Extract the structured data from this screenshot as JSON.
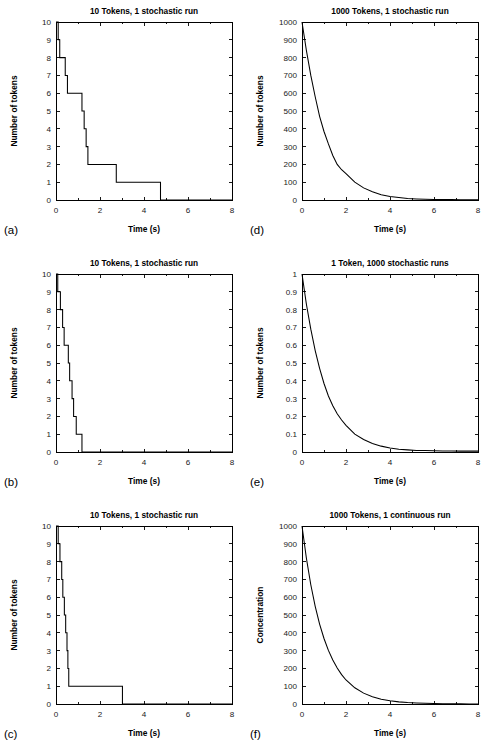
{
  "figure": {
    "background": "#ffffff",
    "line_color": "#000000",
    "panel_count": 6
  },
  "chart_data": [
    {
      "panel": "a",
      "panel_letter": "(a)",
      "type": "line",
      "style": "step",
      "title": "10 Tokens, 1 stochastic run",
      "xlabel": "Time (s)",
      "ylabel": "Number of tokens",
      "xlim": [
        0,
        8
      ],
      "ylim": [
        0,
        10
      ],
      "xticks": [
        0,
        2,
        4,
        6,
        8
      ],
      "xtick_labels": [
        "0",
        "2",
        "4",
        "6",
        "8"
      ],
      "xminor_count": 2,
      "yticks": [
        0,
        1,
        2,
        3,
        4,
        5,
        6,
        7,
        8,
        9,
        10
      ],
      "ytick_labels": [
        "0",
        "1",
        "2",
        "3",
        "4",
        "5",
        "6",
        "7",
        "8",
        "9",
        "10"
      ],
      "grid": false,
      "legend": null,
      "series": [
        {
          "name": "tokens remaining",
          "x": [
            0.0,
            0.1,
            0.1,
            0.17,
            0.17,
            0.42,
            0.42,
            0.52,
            0.52,
            0.62,
            0.62,
            1.18,
            1.18,
            1.28,
            1.28,
            1.37,
            1.37,
            1.45,
            1.45,
            2.74,
            2.74,
            4.75,
            4.75
          ],
          "y": [
            10,
            10,
            9,
            9,
            8,
            8,
            7,
            7,
            6,
            6,
            6,
            6,
            5,
            5,
            4,
            4,
            3,
            3,
            2,
            2,
            1,
            1,
            0
          ]
        }
      ]
    },
    {
      "panel": "b",
      "panel_letter": "(b)",
      "type": "line",
      "style": "step",
      "title": "10 Tokens, 1 stochastic run",
      "xlabel": "Time (s)",
      "ylabel": "Number of tokens",
      "xlim": [
        0,
        8
      ],
      "ylim": [
        0,
        10
      ],
      "xticks": [
        0,
        2,
        4,
        6,
        8
      ],
      "xtick_labels": [
        "0",
        "2",
        "4",
        "6",
        "8"
      ],
      "xminor_count": 2,
      "yticks": [
        0,
        1,
        2,
        3,
        4,
        5,
        6,
        7,
        8,
        9,
        10
      ],
      "ytick_labels": [
        "0",
        "1",
        "2",
        "3",
        "4",
        "5",
        "6",
        "7",
        "8",
        "9",
        "10"
      ],
      "grid": false,
      "legend": null,
      "series": [
        {
          "name": "tokens remaining",
          "x": [
            0.0,
            0.08,
            0.08,
            0.2,
            0.2,
            0.3,
            0.3,
            0.37,
            0.37,
            0.44,
            0.44,
            0.56,
            0.56,
            0.62,
            0.62,
            0.73,
            0.73,
            0.8,
            0.8,
            0.92,
            0.92,
            1.18,
            1.18
          ],
          "y": [
            10,
            10,
            9,
            9,
            8,
            8,
            7,
            7,
            6,
            6,
            6,
            6,
            5,
            5,
            4,
            4,
            3,
            3,
            2,
            2,
            1,
            1,
            0
          ]
        }
      ]
    },
    {
      "panel": "c",
      "panel_letter": "(c)",
      "type": "line",
      "style": "step",
      "title": "10 Tokens, 1 stochastic run",
      "xlabel": "Time (s)",
      "ylabel": "Number of tokens",
      "xlim": [
        0,
        8
      ],
      "ylim": [
        0,
        10
      ],
      "xticks": [
        0,
        2,
        4,
        6,
        8
      ],
      "xtick_labels": [
        "0",
        "2",
        "4",
        "6",
        "8"
      ],
      "xminor_count": 2,
      "yticks": [
        0,
        1,
        2,
        3,
        4,
        5,
        6,
        7,
        8,
        9,
        10
      ],
      "ytick_labels": [
        "0",
        "1",
        "2",
        "3",
        "4",
        "5",
        "6",
        "7",
        "8",
        "9",
        "10"
      ],
      "grid": false,
      "legend": null,
      "series": [
        {
          "name": "tokens remaining",
          "x": [
            0.0,
            0.1,
            0.1,
            0.18,
            0.18,
            0.26,
            0.26,
            0.31,
            0.31,
            0.38,
            0.38,
            0.44,
            0.44,
            0.5,
            0.5,
            0.54,
            0.54,
            0.58,
            0.58,
            0.95,
            0.95,
            3.02,
            3.02
          ],
          "y": [
            10,
            10,
            9,
            9,
            8,
            8,
            7,
            7,
            6,
            6,
            5,
            5,
            4,
            4,
            3,
            3,
            2,
            2,
            1,
            1,
            1,
            1,
            0
          ]
        }
      ]
    },
    {
      "panel": "d",
      "panel_letter": "(d)",
      "type": "line",
      "style": "smooth",
      "title": "1000 Tokens, 1 stochastic run",
      "xlabel": "Time (s)",
      "ylabel": "Number of tokens",
      "xlim": [
        0,
        8
      ],
      "ylim": [
        0,
        1000
      ],
      "xticks": [
        0,
        2,
        4,
        6,
        8
      ],
      "xtick_labels": [
        "0",
        "2",
        "4",
        "6",
        "8"
      ],
      "xminor_count": 2,
      "yticks": [
        0,
        100,
        200,
        300,
        400,
        500,
        600,
        700,
        800,
        900,
        1000
      ],
      "ytick_labels": [
        "0",
        "100",
        "200",
        "300",
        "400",
        "500",
        "600",
        "700",
        "800",
        "900",
        "1000"
      ],
      "grid": false,
      "legend": null,
      "decay_constant": 1.0,
      "initial_value": 1000,
      "series": [
        {
          "name": "tokens remaining",
          "x": [
            0.0,
            0.2,
            0.4,
            0.6,
            0.8,
            1.0,
            1.2,
            1.4,
            1.6,
            1.8,
            2.0,
            2.4,
            2.8,
            3.2,
            3.6,
            4.0,
            4.4,
            4.8,
            5.2,
            5.6,
            6.0,
            6.4,
            6.8,
            7.2,
            7.6,
            8.0
          ],
          "y": [
            1000,
            840,
            700,
            580,
            470,
            385,
            315,
            250,
            200,
            170,
            148,
            100,
            68,
            46,
            30,
            20,
            14,
            9,
            6,
            4,
            3,
            2,
            2,
            1,
            1,
            1
          ]
        }
      ]
    },
    {
      "panel": "e",
      "panel_letter": "(e)",
      "type": "line",
      "style": "smooth",
      "title": "1 Token, 1000 stochastic runs",
      "xlabel": "Time (s)",
      "ylabel": "Number of tokens",
      "xlim": [
        0,
        8
      ],
      "ylim": [
        0,
        1
      ],
      "xticks": [
        0,
        2,
        4,
        6,
        8
      ],
      "xtick_labels": [
        "0",
        "2",
        "4",
        "6",
        "8"
      ],
      "xminor_count": 2,
      "yticks": [
        0,
        0.1,
        0.2,
        0.3,
        0.4,
        0.5,
        0.6,
        0.7,
        0.8,
        0.9,
        1
      ],
      "ytick_labels": [
        "0",
        "0.1",
        "0.2",
        "0.3",
        "0.4",
        "0.5",
        "0.6",
        "0.7",
        "0.8",
        "0.9",
        "1"
      ],
      "grid": false,
      "legend": null,
      "decay_constant": 1.0,
      "initial_value": 1,
      "series": [
        {
          "name": "mean tokens remaining",
          "x": [
            0.0,
            0.2,
            0.4,
            0.6,
            0.8,
            1.0,
            1.2,
            1.4,
            1.6,
            1.8,
            2.0,
            2.4,
            2.8,
            3.2,
            3.6,
            4.0,
            4.4,
            4.8,
            5.2,
            5.6,
            6.0,
            6.4,
            6.8,
            7.2,
            7.6,
            8.0
          ],
          "y": [
            1.0,
            0.83,
            0.69,
            0.57,
            0.47,
            0.385,
            0.315,
            0.26,
            0.215,
            0.18,
            0.15,
            0.1,
            0.07,
            0.048,
            0.033,
            0.022,
            0.016,
            0.012,
            0.009,
            0.008,
            0.007,
            0.006,
            0.006,
            0.005,
            0.005,
            0.005
          ]
        }
      ]
    },
    {
      "panel": "f",
      "panel_letter": "(f)",
      "type": "line",
      "style": "smooth",
      "title": "1000 Tokens, 1 continuous run",
      "xlabel": "Time (s)",
      "ylabel": "Concentration",
      "xlim": [
        0,
        8
      ],
      "ylim": [
        0,
        1000
      ],
      "xticks": [
        0,
        2,
        4,
        6,
        8
      ],
      "xtick_labels": [
        "0",
        "2",
        "4",
        "6",
        "8"
      ],
      "xminor_count": 2,
      "yticks": [
        0,
        100,
        200,
        300,
        400,
        500,
        600,
        700,
        800,
        900,
        1000
      ],
      "ytick_labels": [
        "0",
        "100",
        "200",
        "300",
        "400",
        "500",
        "600",
        "700",
        "800",
        "900",
        "1000"
      ],
      "grid": false,
      "legend": null,
      "decay_constant": 1.0,
      "initial_value": 1000,
      "series": [
        {
          "name": "concentration",
          "x": [
            0.0,
            0.2,
            0.4,
            0.6,
            0.8,
            1.0,
            1.2,
            1.4,
            1.6,
            1.8,
            2.0,
            2.4,
            2.8,
            3.2,
            3.6,
            4.0,
            4.4,
            4.8,
            5.2,
            5.6,
            6.0,
            6.4,
            6.8,
            7.2,
            7.6,
            8.0
          ],
          "y": [
            1000,
            819,
            670,
            549,
            449,
            368,
            301,
            247,
            202,
            165,
            135,
            91,
            61,
            41,
            27,
            18,
            12,
            8,
            5.5,
            3.7,
            2.5,
            1.7,
            1.1,
            0.7,
            0.5,
            0.3
          ]
        }
      ]
    }
  ]
}
